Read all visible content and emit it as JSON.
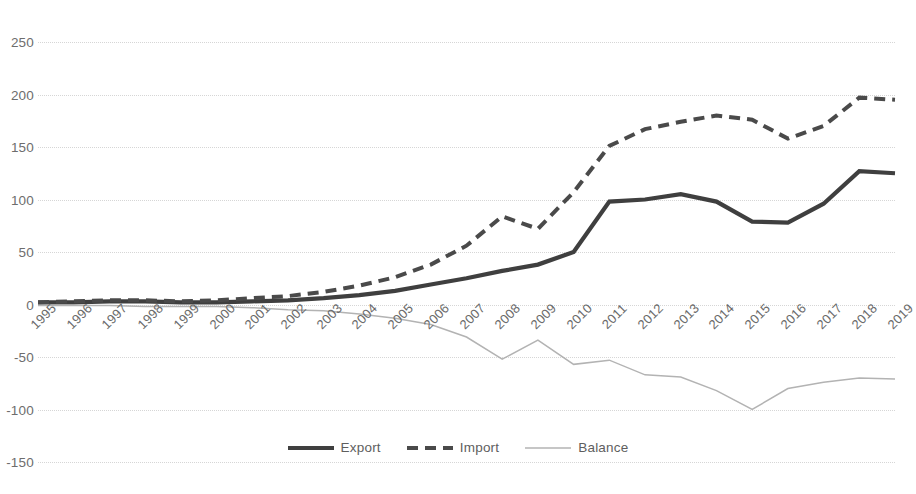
{
  "chart_data": {
    "type": "line",
    "title": "",
    "subtitle": "",
    "xlabel": "",
    "ylabel": "",
    "x": [
      1995,
      1996,
      1997,
      1998,
      1999,
      2000,
      2001,
      2002,
      2003,
      2004,
      2005,
      2006,
      2007,
      2008,
      2009,
      2010,
      2011,
      2012,
      2013,
      2014,
      2015,
      2016,
      2017,
      2018,
      2019
    ],
    "categories": [
      "1995",
      "1996",
      "1997",
      "1998",
      "1999",
      "2000",
      "2001",
      "2002",
      "2003",
      "2004",
      "2005",
      "2006",
      "2007",
      "2008",
      "2009",
      "2010",
      "2011",
      "2012",
      "2013",
      "2014",
      "2015",
      "2016",
      "2017",
      "2018",
      "2019"
    ],
    "series": [
      {
        "name": "Export",
        "style": "solid-thick",
        "color": "#3f3f3f",
        "values": [
          2,
          2,
          3,
          3,
          2,
          2,
          3,
          4,
          6,
          9,
          13,
          19,
          25,
          32,
          38,
          50,
          98,
          100,
          105,
          98,
          79,
          78,
          96,
          127,
          125
        ]
      },
      {
        "name": "Import",
        "style": "dashed",
        "color": "#4a4a4a",
        "values": [
          2,
          3,
          4,
          4,
          3,
          4,
          6,
          8,
          12,
          18,
          26,
          38,
          56,
          84,
          72,
          107,
          151,
          167,
          174,
          180,
          176,
          158,
          170,
          197,
          195
        ]
      },
      {
        "name": "Balance",
        "style": "solid-thin",
        "color": "#b3b3b3",
        "values": [
          -1,
          -1,
          -1,
          -2,
          -2,
          -2,
          -3,
          -5,
          -6,
          -9,
          -13,
          -19,
          -31,
          -52,
          -34,
          -57,
          -53,
          -67,
          -69,
          -82,
          -100,
          -80,
          -74,
          -70,
          -71
        ]
      }
    ],
    "ylim": [
      -150,
      250
    ],
    "yticks": [
      250,
      200,
      150,
      100,
      50,
      0,
      -50,
      -100,
      -150
    ],
    "ytick_labels": [
      "250",
      "200",
      "150",
      "100",
      "50",
      "0",
      "-50",
      "-100",
      "-150"
    ],
    "grid": true,
    "grid_axis": "y",
    "legend": {
      "position": "bottom",
      "entries": [
        {
          "label": "Export",
          "icon": "solid-thick-line-swatch"
        },
        {
          "label": "Import",
          "icon": "dashed-line-swatch"
        },
        {
          "label": "Balance",
          "icon": "thin-line-swatch"
        }
      ]
    },
    "colors": {
      "export": "#3f3f3f",
      "import": "#4a4a4a",
      "balance": "#b3b3b3",
      "grid": "#d6d6d6",
      "text": "#6a6a6a",
      "background": "#ffffff"
    }
  }
}
